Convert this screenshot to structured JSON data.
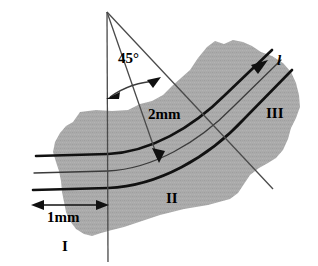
{
  "figure": {
    "background_color": "#ffffff",
    "blob_fill": "#a9a9a9",
    "line_color": "#000000",
    "thin_line_color": "#4a4a4a"
  },
  "labels": {
    "angle": "45°",
    "thickness_upper": "2mm",
    "thickness_lower": "1mm",
    "region_one": "I",
    "region_two": "II",
    "region_three": "III",
    "ray": "l"
  },
  "geometry": {
    "apex": {
      "x": 107,
      "y": 12
    },
    "vertical_line_end": {
      "x": 108,
      "y": 262
    },
    "ray_45_end": {
      "x": 273,
      "y": 189
    },
    "ray_l_arrow_tip": {
      "x": 266,
      "y": 62
    },
    "arc_start": {
      "x": 110,
      "y": 95
    },
    "arc_end": {
      "x": 158,
      "y": 79
    },
    "dim_2mm_arrow_tip": {
      "x": 159,
      "y": 161
    },
    "dim_1mm_left": {
      "x": 33,
      "y": 205
    },
    "dim_1mm_right": {
      "x": 106,
      "y": 205
    },
    "band_line_count": 3
  }
}
